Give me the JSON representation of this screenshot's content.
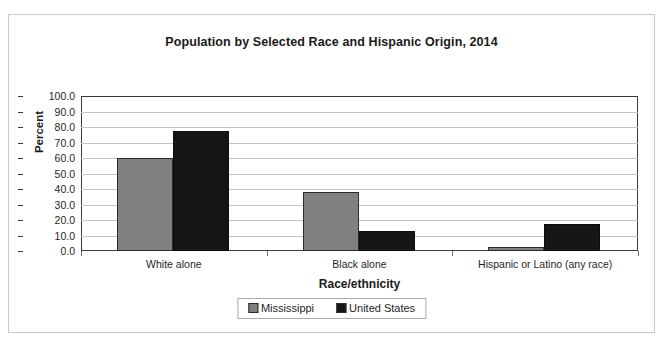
{
  "top_sliver_text": "",
  "chart_data": {
    "type": "bar",
    "title": "Population by Selected Race and Hispanic Origin, 2014",
    "xlabel": "Race/ethnicity",
    "ylabel": "Percent",
    "categories": [
      "White alone",
      "Black alone",
      "Hispanic or Latino (any race)"
    ],
    "series": [
      {
        "name": "Mississippi",
        "color": "#808080",
        "values": [
          59.7,
          37.8,
          2.9
        ]
      },
      {
        "name": "United States",
        "color": "#161616",
        "values": [
          77.4,
          13.2,
          17.3
        ]
      }
    ],
    "ylim": [
      0,
      100
    ],
    "ytick_step": 10,
    "ytick_labels": [
      "100.0",
      "90.0",
      "80.0",
      "70.0",
      "60.0",
      "50.0",
      "40.0",
      "30.0",
      "20.0",
      "10.0",
      "0.0"
    ],
    "grid": true,
    "legend_position": "bottom"
  }
}
